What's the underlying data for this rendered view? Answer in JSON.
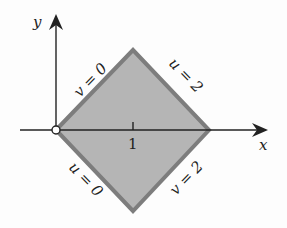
{
  "diagram": {
    "axes": {
      "x_label": "x",
      "y_label": "y"
    },
    "ticks": {
      "x_tick_label": "1"
    },
    "region": {
      "fill": "#b5b5b5",
      "edge": "#7a7a7a",
      "vertices": [
        [
          0,
          0
        ],
        [
          1,
          1
        ],
        [
          2,
          0
        ],
        [
          1,
          -1
        ]
      ]
    },
    "edge_labels": {
      "top_left": "v = 0",
      "top_right": "u = 2",
      "bottom_left": "u = 0",
      "bottom_right": "v = 2"
    },
    "origin_marker": "open-circle"
  }
}
